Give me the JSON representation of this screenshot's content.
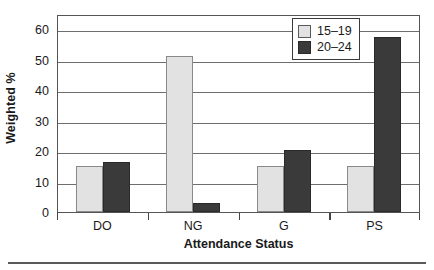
{
  "chart_data": {
    "type": "bar",
    "title": "",
    "xlabel": "Attendance Status",
    "ylabel": "Weighted %",
    "categories": [
      "DO",
      "NG",
      "G",
      "PS"
    ],
    "series": [
      {
        "name": "15-19",
        "label": "15–19",
        "color": "#e2e2e2",
        "values": [
          15.2,
          51.3,
          15.2,
          15.2
        ]
      },
      {
        "name": "20-24",
        "label": "20–24",
        "color": "#3a3a3a",
        "values": [
          16.3,
          2.8,
          20.5,
          57.5
        ]
      }
    ],
    "ylim": [
      0,
      65
    ],
    "yticks": [
      0,
      10,
      20,
      30,
      40,
      50,
      60
    ],
    "ytick_labels": [
      "0",
      "10",
      "20",
      "30",
      "40",
      "50",
      "60"
    ],
    "grid": true,
    "legend_position": "top-right"
  }
}
